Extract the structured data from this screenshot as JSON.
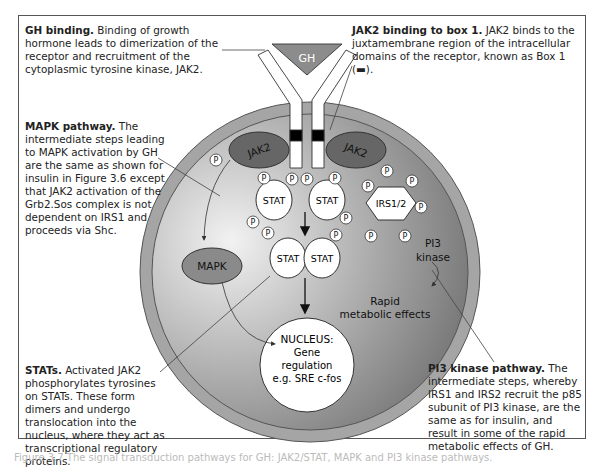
{
  "annotations": {
    "gh_binding": {
      "title": "GH binding.",
      "body": "Binding of growth hormone leads to dimerization of the receptor and recruitment of the cytoplasmic tyrosine kinase, JAK2."
    },
    "jak2_box1": {
      "title": "JAK2 binding to box 1.",
      "body": "JAK2 binds to the juxtamembrane region of the intracellular domains of the receptor, known as Box 1 (▬)."
    },
    "mapk": {
      "title": "MAPK pathway.",
      "body": "The intermediate steps leading to MAPK activation by GH are the same as shown for insulin in Figure 3.6 except that JAK2 activation of the Grb2.Sos complex is not dependent on IRS1 and proceeds via Shc."
    },
    "stats": {
      "title": "STATs.",
      "body": "Activated JAK2 phosphorylates tyrosines on STATs. These form dimers and undergo translocation into the nucleus, where they act as transcriptional regulatory proteins."
    },
    "pi3k": {
      "title": "PI3 kinase pathway.",
      "body": "The intermediate steps, whereby IRS1 and IRS2 recruit the p85 subunit of PI3 kinase, are the same as for insulin, and result in some of the rapid metabolic effects of GH."
    }
  },
  "diagram": {
    "hormone": "GH",
    "kinase_left": "JAK2",
    "kinase_right": "JAK2",
    "phospho": "P",
    "stat": "STAT",
    "irs": "IRS1/2",
    "mapk": "MAPK",
    "pi3_line1": "PI3",
    "pi3_line2": "kinase",
    "rapid_line1": "Rapid",
    "rapid_line2": "metabolic effects",
    "nucleus_title": "NUCLEUS:",
    "nucleus_line1": "Gene",
    "nucleus_line2": "regulation",
    "nucleus_line3": "e.g. SRE c-fos",
    "colors": {
      "membrane": "#9a9a9a",
      "cytoplasm_light": "#e6e6e6",
      "cytoplasm_dark": "#7a7a7a",
      "jak2": "#666666",
      "mapk": "#8a8a8a",
      "hormone": "#8c8c8c",
      "box1": "#000000"
    }
  },
  "caption": "Figure 3.7 The signal transduction pathways for GH: JAK2/STAT, MAPK and PI3 kinase pathways."
}
